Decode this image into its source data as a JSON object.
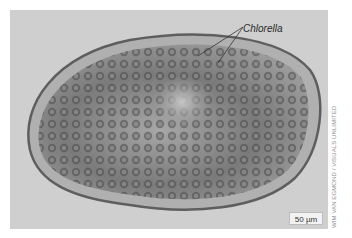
{
  "image": {
    "subject": "Paramecium cell containing Chlorella",
    "background_color": "#cfcfcf",
    "cell_fill_color": "#8a8a8a"
  },
  "annotations": {
    "chlorella_label": "Chlorella"
  },
  "scale_bar": {
    "label": "50 µm"
  },
  "credit": {
    "text": "WIM VAN EGMOND / VISUALS UNLIMITED"
  }
}
